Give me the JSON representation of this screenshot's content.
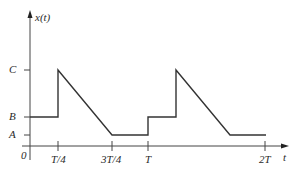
{
  "diagram": {
    "type": "signal-waveform",
    "y_axis_label": "x(t)",
    "x_axis_label": "t",
    "origin_label": "0",
    "y_levels": [
      {
        "name": "C",
        "label": "C"
      },
      {
        "name": "B",
        "label": "B"
      },
      {
        "name": "A",
        "label": "A"
      }
    ],
    "x_ticks": [
      {
        "name": "quarter-period",
        "label": "T/4"
      },
      {
        "name": "three-quarter-period",
        "label": "3T/4"
      },
      {
        "name": "period",
        "label": "T"
      },
      {
        "name": "two-periods",
        "label": "2T"
      }
    ],
    "waveform_description": "Periodic signal with period T: holds B on [0,T/4), jumps to C at T/4, decreases linearly to A at 3T/4, holds A until T, then repeats.",
    "colors": {
      "line": "#333333",
      "axis": "#444444",
      "text": "#2a2a2a"
    }
  }
}
